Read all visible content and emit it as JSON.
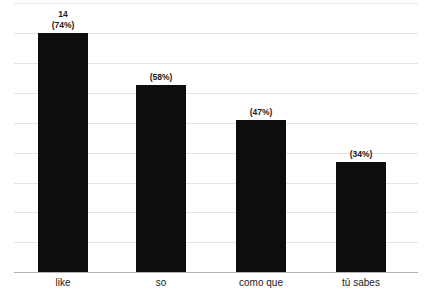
{
  "chart_data": {
    "type": "bar",
    "title": "",
    "xlabel": "",
    "ylabel": "",
    "categories": [
      "like",
      "so",
      "como que",
      "tú sabes"
    ],
    "values": [
      74,
      58,
      47,
      34
    ],
    "value_labels": [
      "(74%)",
      "(58%)",
      "(47%)",
      "(34%)"
    ],
    "count_labels": [
      "14",
      "",
      "",
      ""
    ],
    "ylim": [
      0,
      74
    ],
    "grid": true,
    "gridlines": 8,
    "legend": "none",
    "bar_color": "#0d0d0d",
    "gridline_color": "#e4e4e4",
    "axis_color": "#b4b4b4"
  },
  "bars": [
    {
      "category": "like",
      "count": "14",
      "percent": "(74%)",
      "value": 74
    },
    {
      "category": "so",
      "count": "",
      "percent": "(58%)",
      "value": 58
    },
    {
      "category": "como que",
      "count": "",
      "percent": "(47%)",
      "value": 47
    },
    {
      "category": "tú sabes",
      "count": "",
      "percent": "(34%)",
      "value": 34
    }
  ]
}
